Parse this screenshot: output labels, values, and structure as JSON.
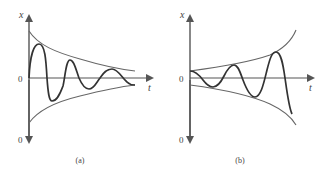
{
  "figure": {
    "panels": [
      {
        "id": "a",
        "caption": "(a)",
        "y_axis_label": "x",
        "x_axis_label": "t",
        "origin_label": "0",
        "bottom_label": "0",
        "description": "Damped oscillation within a decaying exponential envelope"
      },
      {
        "id": "b",
        "caption": "(b)",
        "y_axis_label": "x",
        "x_axis_label": "t",
        "origin_label": "0",
        "bottom_label": "0",
        "description": "Growing oscillation within an expanding exponential envelope"
      }
    ],
    "colors": {
      "axis": "#555555",
      "envelope": "#666666",
      "curve": "#333333",
      "text": "#444444"
    }
  }
}
